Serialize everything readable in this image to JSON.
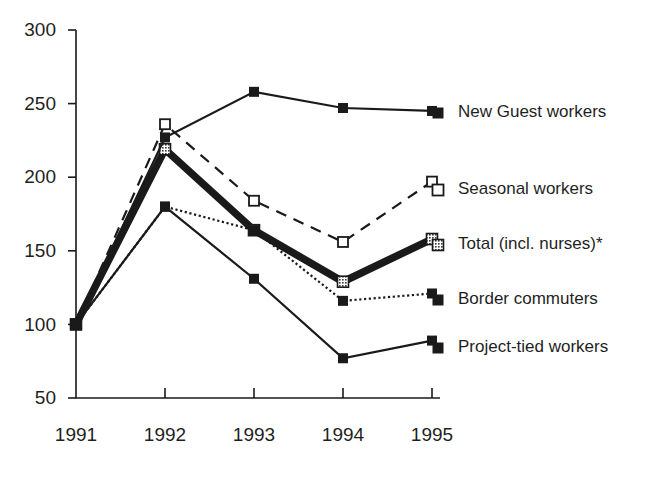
{
  "chart_data": {
    "type": "line",
    "title": "",
    "subtitle": "",
    "xlabel": "",
    "ylabel": "",
    "categories": [
      "1991",
      "1992",
      "1993",
      "1994",
      "1995"
    ],
    "x_tick_labels": [
      "1991",
      "1992",
      "1993",
      "1994",
      "1995"
    ],
    "y_tick_labels": [
      "300",
      "250",
      "200",
      "150",
      "100",
      "50"
    ],
    "y_ticks": [
      300,
      250,
      200,
      150,
      100,
      50
    ],
    "ylim": [
      50,
      300
    ],
    "grid": false,
    "legend_position": "right",
    "note": "Index 1991 = 100",
    "series": [
      {
        "name": "New Guest workers",
        "values": [
          100,
          227,
          258,
          247,
          245
        ],
        "line_style": "solid",
        "line_width": "thin",
        "marker": "filled-square",
        "color": "#1a1a1a"
      },
      {
        "name": "Seasonal workers",
        "values": [
          100,
          236,
          184,
          156,
          197
        ],
        "line_style": "dashed",
        "line_width": "thin",
        "marker": "open-square",
        "color": "#1a1a1a"
      },
      {
        "name": "Total (incl. nurses)*",
        "values": [
          100,
          219,
          164,
          129,
          158
        ],
        "line_style": "solid",
        "line_width": "thick",
        "marker": "hatched-square",
        "color": "#1a1a1a"
      },
      {
        "name": "Border commuters",
        "values": [
          100,
          180,
          164,
          116,
          121
        ],
        "line_style": "dotted",
        "line_width": "thin",
        "marker": "filled-square",
        "color": "#1a1a1a"
      },
      {
        "name": "Project-tied workers",
        "values": [
          100,
          180,
          131,
          77,
          89
        ],
        "line_style": "solid",
        "line_width": "thin",
        "marker": "filled-square",
        "color": "#1a1a1a"
      }
    ]
  },
  "legend": {
    "entries": [
      {
        "label": "New Guest workers",
        "marker": "filled-square"
      },
      {
        "label": "Seasonal workers",
        "marker": "open-square"
      },
      {
        "label": "Total (incl. nurses)*",
        "marker": "hatched-square"
      },
      {
        "label": "Border commuters",
        "marker": "filled-square"
      },
      {
        "label": "Project-tied workers",
        "marker": "filled-square"
      }
    ]
  },
  "axis": {
    "y_labels": [
      "300",
      "250",
      "200",
      "150",
      "100",
      "50"
    ],
    "x_labels": [
      "1991",
      "1992",
      "1993",
      "1994",
      "1995"
    ]
  },
  "colors": {
    "ink": "#1a1a1a",
    "background": "#ffffff",
    "hatch_fill": "#8a8a8a"
  }
}
